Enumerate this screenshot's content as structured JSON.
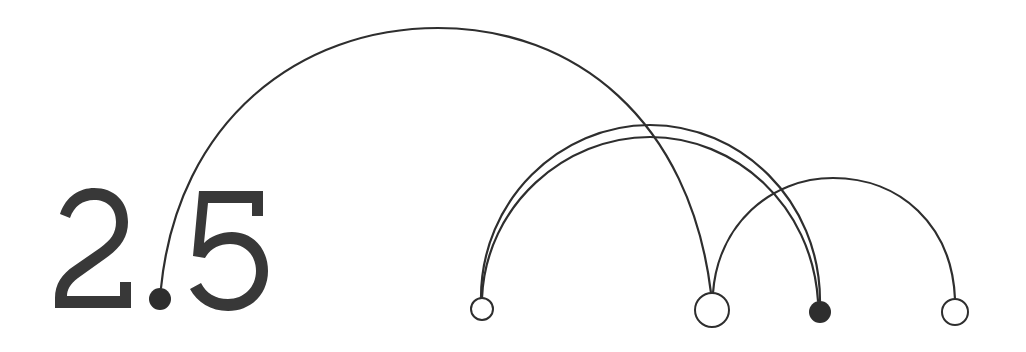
{
  "title_number": {
    "text": "2.5",
    "digits": [
      "2",
      "5"
    ],
    "decimal_point_is_node": true,
    "color": "#383838"
  },
  "diagram": {
    "type": "arc-diagram",
    "baseline_y": 310,
    "line_color": "#2e2e2e",
    "nodes": [
      {
        "id": "n0",
        "label": "decimal point",
        "x": 160,
        "y": 299,
        "r": 11,
        "filled": true
      },
      {
        "id": "n1",
        "label": "",
        "x": 482,
        "y": 309,
        "r": 11,
        "filled": false
      },
      {
        "id": "n2",
        "label": "",
        "x": 712,
        "y": 310,
        "r": 17,
        "filled": false
      },
      {
        "id": "n3",
        "label": "",
        "x": 820,
        "y": 312,
        "r": 11,
        "filled": true
      },
      {
        "id": "n4",
        "label": "",
        "x": 955,
        "y": 312,
        "r": 13,
        "filled": false
      }
    ],
    "arcs": [
      {
        "from": "n0",
        "to": "n2",
        "peak_y": 28
      },
      {
        "from": "n1",
        "to": "n3",
        "peak_y": 125
      },
      {
        "from": "n1",
        "to": "n3",
        "peak_y": 137
      },
      {
        "from": "n2",
        "to": "n4",
        "peak_y": 178
      }
    ]
  }
}
